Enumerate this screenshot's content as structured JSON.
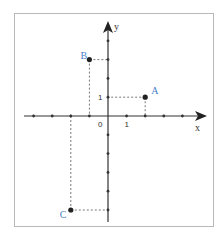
{
  "diagram": {
    "type": "coordinate-plane",
    "axes": {
      "x_label": "x",
      "y_label": "y",
      "x_range": [
        -4,
        4
      ],
      "y_range": [
        -5,
        4
      ],
      "origin_label": "0",
      "unit_x_label": "1",
      "unit_y_label": "1"
    },
    "points": [
      {
        "name": "A",
        "x": 2,
        "y": 1
      },
      {
        "name": "B",
        "x": -1,
        "y": 3
      },
      {
        "name": "C",
        "x": -2,
        "y": -5
      }
    ],
    "colors": {
      "point_label": "#4a7fc8",
      "axis": "#333333",
      "frame": "#b8b8b8"
    }
  }
}
